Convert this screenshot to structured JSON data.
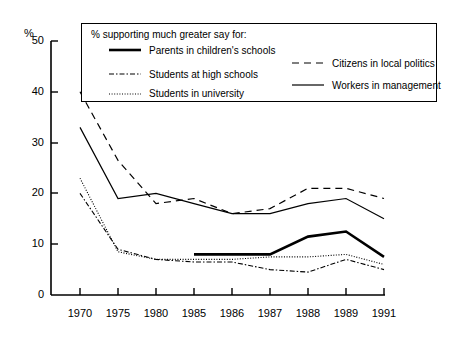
{
  "chart_data": {
    "type": "line",
    "title": "",
    "xlabel": "",
    "ylabel": "%",
    "ylim": [
      0,
      50
    ],
    "yticks": [
      0,
      10,
      20,
      30,
      40,
      50
    ],
    "grid": false,
    "legend_position": "top-inside",
    "legend_title": "% supporting much greater say for:",
    "categories": [
      "1970",
      "1975",
      "1980",
      "1985",
      "1986",
      "1987",
      "1988",
      "1989",
      "1991"
    ],
    "series": [
      {
        "name": "Parents in children's schools",
        "style": "thick-solid",
        "color": "#000000",
        "values": [
          null,
          null,
          null,
          8,
          8,
          8,
          11.5,
          12.5,
          7.5
        ]
      },
      {
        "name": "Students at high schools",
        "style": "dash-dot",
        "color": "#000000",
        "values": [
          20,
          9,
          7,
          6.5,
          6.5,
          5,
          4.5,
          7,
          5
        ]
      },
      {
        "name": "Students in university",
        "style": "dotted",
        "color": "#000000",
        "values": [
          23,
          8.5,
          7,
          7,
          7,
          7.5,
          7.5,
          8,
          6
        ]
      },
      {
        "name": "Citizens in local politics",
        "style": "dashed",
        "color": "#000000",
        "values": [
          40,
          26.5,
          18,
          19,
          16,
          17,
          21,
          21,
          19
        ]
      },
      {
        "name": "Workers in management",
        "style": "thin-solid",
        "color": "#000000",
        "values": [
          33,
          19,
          20,
          18,
          16,
          16,
          18,
          19,
          15
        ]
      }
    ]
  },
  "axes": {
    "y_unit_label": "%",
    "y_tick_labels": [
      "50",
      "40",
      "30",
      "20",
      "10",
      "0"
    ],
    "x_tick_labels": [
      "1970",
      "1975",
      "1980",
      "1985",
      "1986",
      "1987",
      "1988",
      "1989",
      "1991"
    ]
  },
  "legend": {
    "title": "% supporting much greater say for:",
    "entries": [
      {
        "label": "Parents in children's schools",
        "style": "thick-solid"
      },
      {
        "label": "Students at high schools",
        "style": "dash-dot"
      },
      {
        "label": "Students in university",
        "style": "dotted"
      },
      {
        "label": "Citizens in local politics",
        "style": "dashed"
      },
      {
        "label": "Workers in management",
        "style": "thin-solid"
      }
    ]
  }
}
